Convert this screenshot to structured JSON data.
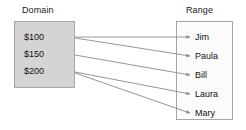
{
  "diagram": {
    "type": "mapping-diagram",
    "domain": {
      "title": "Domain",
      "items": [
        {
          "label": "$100"
        },
        {
          "label": "$150"
        },
        {
          "label": "$200"
        }
      ]
    },
    "range": {
      "title": "Range",
      "items": [
        {
          "label": "Jim"
        },
        {
          "label": "Paula"
        },
        {
          "label": "Bill"
        },
        {
          "label": "Laura"
        },
        {
          "label": "Mary"
        }
      ]
    },
    "mappings": [
      {
        "from": "$100",
        "to": "Jim",
        "x1": 75,
        "y1": 37,
        "x2": 190,
        "y2": 37
      },
      {
        "from": "$100",
        "to": "Paula",
        "x1": 75,
        "y1": 38,
        "x2": 190,
        "y2": 56
      },
      {
        "from": "$150",
        "to": "Bill",
        "x1": 75,
        "y1": 55,
        "x2": 190,
        "y2": 75
      },
      {
        "from": "$200",
        "to": "Laura",
        "x1": 75,
        "y1": 72,
        "x2": 190,
        "y2": 94
      },
      {
        "from": "$200",
        "to": "Mary",
        "x1": 75,
        "y1": 73,
        "x2": 190,
        "y2": 113
      }
    ],
    "colors": {
      "domain_fill": "#d4d4d4",
      "range_fill": "#fbfbfb",
      "box_border": "#a6a6a6",
      "arrow": "#8a8a8a",
      "text": "#111111",
      "background": "#ffffff"
    }
  }
}
